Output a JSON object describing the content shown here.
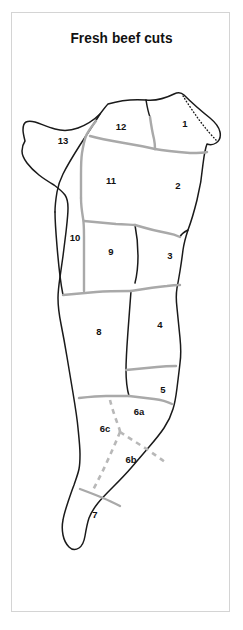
{
  "page": {
    "title": "Fresh beef cuts",
    "background_color": "#ffffff",
    "frame_border_color": "#d4d4d4"
  },
  "diagram": {
    "name": "beef-carcass-cut-chart",
    "outline_color": "#1a1a1a",
    "divider_color": "#a9a9a9",
    "dashed_color": "#b8b8b8",
    "fill_color": "#ffffff",
    "labels": [
      {
        "id": "cut-1",
        "text": "1",
        "x": 185,
        "y": 124
      },
      {
        "id": "cut-2",
        "text": "2",
        "x": 178,
        "y": 186
      },
      {
        "id": "cut-3",
        "text": "3",
        "x": 170,
        "y": 256
      },
      {
        "id": "cut-4",
        "text": "4",
        "x": 160,
        "y": 325
      },
      {
        "id": "cut-5",
        "text": "5",
        "x": 163,
        "y": 390
      },
      {
        "id": "cut-6a",
        "text": "6a",
        "x": 139,
        "y": 412
      },
      {
        "id": "cut-6b",
        "text": "6b",
        "x": 131,
        "y": 460
      },
      {
        "id": "cut-6c",
        "text": "6c",
        "x": 105,
        "y": 429
      },
      {
        "id": "cut-7",
        "text": "7",
        "x": 95,
        "y": 515
      },
      {
        "id": "cut-8",
        "text": "8",
        "x": 99,
        "y": 332
      },
      {
        "id": "cut-9",
        "text": "9",
        "x": 111,
        "y": 252
      },
      {
        "id": "cut-10",
        "text": "10",
        "x": 75,
        "y": 238
      },
      {
        "id": "cut-11",
        "text": "11",
        "x": 111,
        "y": 181
      },
      {
        "id": "cut-12",
        "text": "12",
        "x": 121,
        "y": 127
      },
      {
        "id": "cut-13",
        "text": "13",
        "x": 63,
        "y": 141
      }
    ]
  }
}
